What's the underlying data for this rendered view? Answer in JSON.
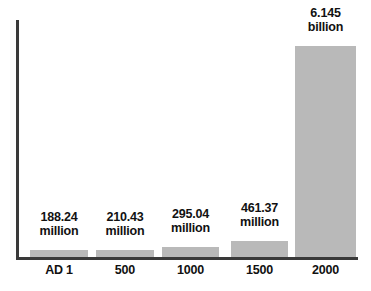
{
  "chart_data": {
    "type": "bar",
    "title": "",
    "subtitle": "",
    "xlabel": "",
    "ylabel": "",
    "grid": false,
    "legend": "none",
    "axis_color": "#3a3a3a",
    "bar_color": "#b9b9b9",
    "label_color": "#111111",
    "categories": [
      "AD 1",
      "500",
      "1000",
      "1500",
      "2000"
    ],
    "values": [
      188240000,
      210430000,
      295040000,
      461370000,
      6145000000
    ],
    "value_labels": [
      {
        "number": "188.24",
        "unit": "million"
      },
      {
        "number": "210.43",
        "unit": "million"
      },
      {
        "number": "295.04",
        "unit": "million"
      },
      {
        "number": "461.37",
        "unit": "million"
      },
      {
        "number": "6.145",
        "unit": "billion"
      }
    ],
    "ylim": [
      0,
      6145000000
    ],
    "bars": [
      {
        "category": "AD 1",
        "number": "188.24",
        "unit": "million",
        "left": 30,
        "width": 58,
        "height": 7,
        "label_left": 25,
        "label_bottom": 52
      },
      {
        "category": "500",
        "number": "210.43",
        "unit": "million",
        "left": 96,
        "width": 58,
        "height": 7,
        "label_left": 91,
        "label_bottom": 52
      },
      {
        "category": "1000",
        "number": "295.04",
        "unit": "million",
        "left": 162,
        "width": 57,
        "height": 10,
        "label_left": 157,
        "label_bottom": 55
      },
      {
        "category": "1500",
        "number": "461.37",
        "unit": "million",
        "left": 231,
        "width": 57,
        "height": 16,
        "label_left": 226,
        "label_bottom": 61
      },
      {
        "category": "2000",
        "number": "6.145",
        "unit": "billion",
        "left": 295,
        "width": 61,
        "height": 211,
        "label_left": 290,
        "label_bottom": 256
      }
    ],
    "ticks": [
      {
        "label": "AD 1",
        "left": 30,
        "width": 58
      },
      {
        "label": "500",
        "left": 96,
        "width": 58
      },
      {
        "label": "1000",
        "left": 162,
        "width": 57
      },
      {
        "label": "1500",
        "left": 231,
        "width": 57
      },
      {
        "label": "2000",
        "left": 295,
        "width": 61
      }
    ]
  }
}
